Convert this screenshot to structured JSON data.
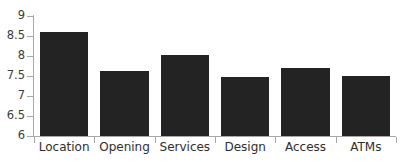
{
  "chart_data": {
    "type": "bar",
    "title": "",
    "subtitle": "",
    "xlabel": "",
    "ylabel": "",
    "categories": [
      "Location",
      "Opening",
      "Services",
      "Design",
      "Access",
      "ATMs"
    ],
    "values": [
      8.6,
      7.63,
      8.02,
      7.48,
      7.71,
      7.49
    ],
    "series": [
      {
        "name": "Rating",
        "values": [
          8.6,
          7.63,
          8.02,
          7.48,
          7.71,
          7.49
        ]
      }
    ],
    "ylim": [
      6,
      9
    ],
    "yticks": [
      6,
      6.5,
      7,
      7.5,
      8,
      8.5,
      9
    ],
    "ytick_labels": [
      "6",
      "6.5",
      "7",
      "7.5",
      "8",
      "8.5",
      "9"
    ],
    "grid": false,
    "legend": false,
    "legend_position": "none",
    "annotations": [],
    "colors": {
      "bar_fill": "#232323",
      "axis": "#a8a8a8",
      "tick_label": "#3d3d3d",
      "category_label": "#2e2e2e",
      "background": "#ffffff"
    }
  }
}
